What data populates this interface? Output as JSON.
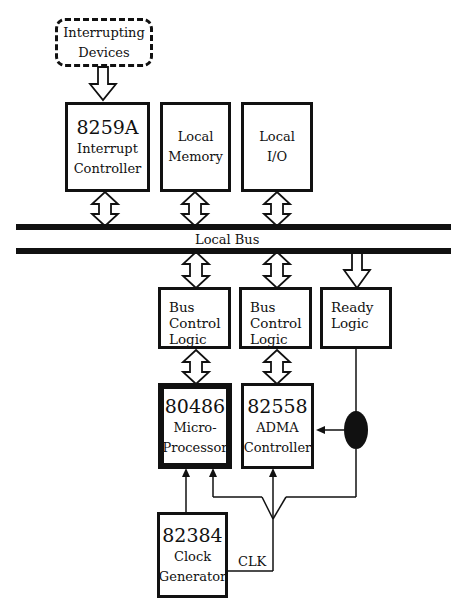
{
  "diagram": {
    "interrupting_devices": {
      "line1": "Interrupting",
      "line2": "Devices"
    },
    "pic": {
      "part": "8259A",
      "line1": "Interrupt",
      "line2": "Controller"
    },
    "local_memory": {
      "line1": "Local",
      "line2": "Memory"
    },
    "local_io": {
      "line1": "Local",
      "line2": "I/O"
    },
    "local_bus": {
      "label": "Local Bus"
    },
    "bus_control_1": {
      "line1": "Bus",
      "line2": "Control",
      "line3": "Logic"
    },
    "bus_control_2": {
      "line1": "Bus",
      "line2": "Control",
      "line3": "Logic"
    },
    "ready_logic": {
      "line1": "Ready",
      "line2": "Logic"
    },
    "cpu": {
      "part": "80486",
      "line1": "Micro-",
      "line2": "Processor"
    },
    "adma": {
      "part": "82558",
      "line1": "ADMA",
      "line2": "Controller"
    },
    "clock": {
      "part": "82384",
      "line1": "Clock",
      "line2": "Generator"
    },
    "clk_label": "CLK"
  }
}
